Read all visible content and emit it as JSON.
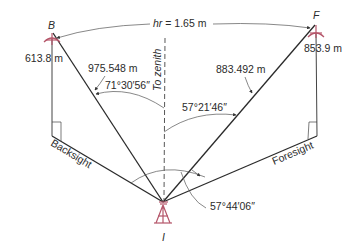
{
  "diagram": {
    "points": {
      "backsight_target": "B",
      "foresight_target": "F",
      "instrument": "I"
    },
    "labels": {
      "hr": "hr = 1.65 m",
      "hr_symbol": "hr",
      "hr_value": " = 1.65 m",
      "b_elevation": "613.8 m",
      "f_elevation": "853.9 m",
      "b_slope_distance": "975.548 m",
      "f_slope_distance": "883.492 m",
      "b_zenith_angle": "71°30′56″",
      "f_zenith_angle": "57°21′46″",
      "horizontal_angle": "57°44′06″",
      "zenith": "To zenith",
      "backsight": "Backsight",
      "foresight": "Foresight"
    },
    "colors": {
      "lines": "#2a2a2a",
      "instrument": "#b5566a",
      "text": "#2b2b2b"
    }
  }
}
